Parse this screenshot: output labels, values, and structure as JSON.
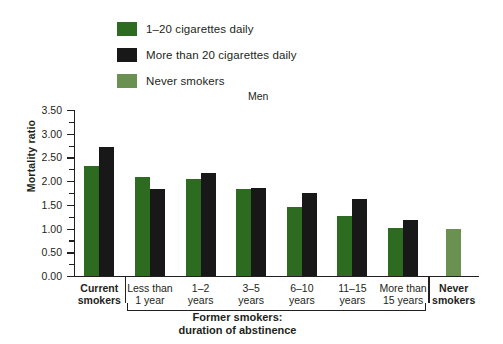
{
  "legend": {
    "items": [
      {
        "label": "1–20 cigarettes daily",
        "color": "#2d6b21"
      },
      {
        "label": "More than 20 cigarettes daily",
        "color": "#181818"
      },
      {
        "label": "Never smokers",
        "color": "#6b9152"
      }
    ]
  },
  "axis": {
    "y_title": "Mortality ratio",
    "y_ticks": [
      "3.50",
      "3.00",
      "2.50",
      "2.00",
      "1.50",
      "1.00",
      "0.50",
      "0.00"
    ]
  },
  "bracket": {
    "line1": "Former smokers:",
    "line2": "duration of abstinence"
  },
  "chart_data": {
    "type": "bar",
    "title": "Men",
    "xlabel": "",
    "ylabel": "Mortality ratio",
    "ylim": [
      0.0,
      3.5
    ],
    "ytick_step": 0.5,
    "yminor_step": 0.25,
    "grid": false,
    "legend_position": "top-left",
    "categories": [
      "Current smokers",
      "Less than 1 year",
      "1–2 years",
      "3–5 years",
      "6–10 years",
      "11–15 years",
      "More than 15 years",
      "Never smokers"
    ],
    "category_lines": [
      [
        "Current",
        "smokers"
      ],
      [
        "Less than",
        "1 year"
      ],
      [
        "1–2",
        "years"
      ],
      [
        "3–5",
        "years"
      ],
      [
        "6–10",
        "years"
      ],
      [
        "11–15",
        "years"
      ],
      [
        "More than",
        "15 years"
      ],
      [
        "Never",
        "smokers"
      ]
    ],
    "series": [
      {
        "name": "1–20 cigarettes daily",
        "color": "#2d6b21",
        "values": [
          2.32,
          2.08,
          2.05,
          1.83,
          1.45,
          1.27,
          1.02,
          null
        ]
      },
      {
        "name": "More than 20 cigarettes daily",
        "color": "#181818",
        "values": [
          2.72,
          1.83,
          2.17,
          1.85,
          1.75,
          1.63,
          1.18,
          null
        ]
      },
      {
        "name": "Never smokers",
        "color": "#6b9152",
        "values": [
          null,
          null,
          null,
          null,
          null,
          null,
          null,
          1.0
        ]
      }
    ]
  }
}
